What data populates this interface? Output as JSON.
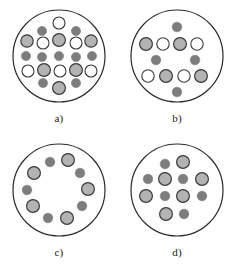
{
  "figure": {
    "background_color": "#ffffff",
    "panel_count": 4,
    "legend_note": "Three particle types: open/white circle, light-gray filled circle, dark-gray filled circle"
  },
  "styles": {
    "boundary_stroke": "#2b2b2b",
    "boundary_fill": "#ffffff",
    "boundary_stroke_width": 1.2,
    "open_fill": "#ffffff",
    "open_stroke": "#3a3a3a",
    "light_fill": "#b3b3b3",
    "light_stroke": "#3a3a3a",
    "dark_fill": "#7d7d7d",
    "dark_stroke": "#7d7d7d",
    "label_color": "#1b1b1b"
  },
  "panels": [
    {
      "id": "a",
      "label": "a)",
      "boundary": {
        "cx": 59,
        "cy": 56,
        "r": 46
      },
      "circle_count": 18,
      "counts": {
        "open": 6,
        "light": 5,
        "dark": 7
      },
      "circles": [
        {
          "cx": 59,
          "cy": 23,
          "r": 6.0,
          "type": "open"
        },
        {
          "cx": 42,
          "cy": 31,
          "r": 4.6,
          "type": "dark"
        },
        {
          "cx": 76,
          "cy": 31,
          "r": 4.6,
          "type": "dark"
        },
        {
          "cx": 27,
          "cy": 41,
          "r": 6.2,
          "type": "light"
        },
        {
          "cx": 43,
          "cy": 43,
          "r": 6.0,
          "type": "open"
        },
        {
          "cx": 59,
          "cy": 40,
          "r": 6.4,
          "type": "light"
        },
        {
          "cx": 76,
          "cy": 43,
          "r": 6.0,
          "type": "open"
        },
        {
          "cx": 91,
          "cy": 41,
          "r": 6.2,
          "type": "light"
        },
        {
          "cx": 26,
          "cy": 56,
          "r": 4.6,
          "type": "dark"
        },
        {
          "cx": 42,
          "cy": 57,
          "r": 4.6,
          "type": "dark"
        },
        {
          "cx": 59,
          "cy": 56,
          "r": 4.6,
          "type": "dark"
        },
        {
          "cx": 76,
          "cy": 57,
          "r": 4.6,
          "type": "dark"
        },
        {
          "cx": 92,
          "cy": 56,
          "r": 4.6,
          "type": "dark"
        },
        {
          "cx": 28,
          "cy": 71,
          "r": 6.0,
          "type": "open"
        },
        {
          "cx": 44,
          "cy": 70,
          "r": 6.4,
          "type": "light"
        },
        {
          "cx": 60,
          "cy": 71,
          "r": 6.0,
          "type": "open"
        },
        {
          "cx": 76,
          "cy": 70,
          "r": 6.4,
          "type": "light"
        },
        {
          "cx": 91,
          "cy": 71,
          "r": 6.0,
          "type": "open"
        },
        {
          "cx": 43,
          "cy": 83,
          "r": 4.6,
          "type": "dark"
        },
        {
          "cx": 76,
          "cy": 83,
          "r": 4.6,
          "type": "dark"
        },
        {
          "cx": 59,
          "cy": 88,
          "r": 6.4,
          "type": "light"
        }
      ]
    },
    {
      "id": "b",
      "label": "b)",
      "boundary": {
        "cx": 59,
        "cy": 56,
        "r": 46
      },
      "circle_count": 11,
      "counts": {
        "open": 4,
        "light": 4,
        "dark": 4
      },
      "circles": [
        {
          "cx": 59,
          "cy": 27,
          "r": 4.8,
          "type": "dark"
        },
        {
          "cx": 28,
          "cy": 44,
          "r": 6.4,
          "type": "light"
        },
        {
          "cx": 45,
          "cy": 44,
          "r": 6.2,
          "type": "open"
        },
        {
          "cx": 62,
          "cy": 44,
          "r": 6.4,
          "type": "light"
        },
        {
          "cx": 79,
          "cy": 44,
          "r": 6.2,
          "type": "open"
        },
        {
          "cx": 38,
          "cy": 60,
          "r": 4.8,
          "type": "dark"
        },
        {
          "cx": 77,
          "cy": 60,
          "r": 4.8,
          "type": "dark"
        },
        {
          "cx": 30,
          "cy": 76,
          "r": 6.2,
          "type": "open"
        },
        {
          "cx": 48,
          "cy": 76,
          "r": 6.4,
          "type": "light"
        },
        {
          "cx": 66,
          "cy": 76,
          "r": 6.2,
          "type": "open"
        },
        {
          "cx": 83,
          "cy": 76,
          "r": 6.4,
          "type": "light"
        },
        {
          "cx": 59,
          "cy": 92,
          "r": 4.8,
          "type": "dark"
        }
      ]
    },
    {
      "id": "c",
      "label": "c)",
      "boundary": {
        "cx": 59,
        "cy": 56,
        "r": 46
      },
      "circle_count": 10,
      "counts": {
        "open": 0,
        "light": 5,
        "dark": 5
      },
      "arrangement": "ring",
      "circles": [
        {
          "cx": 68,
          "cy": 26,
          "r": 6.4,
          "type": "light"
        },
        {
          "cx": 50,
          "cy": 28,
          "r": 4.8,
          "type": "dark"
        },
        {
          "cx": 34,
          "cy": 39,
          "r": 6.4,
          "type": "light"
        },
        {
          "cx": 27,
          "cy": 56,
          "r": 4.8,
          "type": "dark"
        },
        {
          "cx": 33,
          "cy": 72,
          "r": 6.4,
          "type": "light"
        },
        {
          "cx": 48,
          "cy": 84,
          "r": 4.8,
          "type": "dark"
        },
        {
          "cx": 67,
          "cy": 84,
          "r": 6.4,
          "type": "light"
        },
        {
          "cx": 82,
          "cy": 72,
          "r": 4.8,
          "type": "dark"
        },
        {
          "cx": 88,
          "cy": 55,
          "r": 6.4,
          "type": "light"
        },
        {
          "cx": 80,
          "cy": 39,
          "r": 4.8,
          "type": "dark"
        }
      ]
    },
    {
      "id": "d",
      "label": "d)",
      "boundary": {
        "cx": 59,
        "cy": 56,
        "r": 46
      },
      "circle_count": 12,
      "counts": {
        "open": 0,
        "light": 6,
        "dark": 6
      },
      "circles": [
        {
          "cx": 65,
          "cy": 28,
          "r": 6.4,
          "type": "light"
        },
        {
          "cx": 47,
          "cy": 30,
          "r": 4.8,
          "type": "dark"
        },
        {
          "cx": 30,
          "cy": 45,
          "r": 4.8,
          "type": "dark"
        },
        {
          "cx": 47,
          "cy": 45,
          "r": 6.4,
          "type": "light"
        },
        {
          "cx": 65,
          "cy": 45,
          "r": 4.8,
          "type": "dark"
        },
        {
          "cx": 84,
          "cy": 45,
          "r": 6.4,
          "type": "light"
        },
        {
          "cx": 28,
          "cy": 62,
          "r": 6.4,
          "type": "light"
        },
        {
          "cx": 47,
          "cy": 62,
          "r": 4.8,
          "type": "dark"
        },
        {
          "cx": 65,
          "cy": 62,
          "r": 6.4,
          "type": "light"
        },
        {
          "cx": 84,
          "cy": 62,
          "r": 4.8,
          "type": "dark"
        },
        {
          "cx": 48,
          "cy": 80,
          "r": 6.4,
          "type": "light"
        },
        {
          "cx": 66,
          "cy": 80,
          "r": 4.8,
          "type": "dark"
        }
      ]
    }
  ]
}
